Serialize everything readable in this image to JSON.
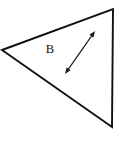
{
  "figure": {
    "background_color": "#ffffff",
    "stroke_color": "#111111",
    "canvas": {
      "width": 126,
      "height": 156
    },
    "shape": {
      "name": "triangle",
      "label": "B",
      "label_position": {
        "x": 50,
        "y": 50
      },
      "vertices": [
        {
          "x": 2,
          "y": 50
        },
        {
          "x": 113,
          "y": 9
        },
        {
          "x": 112,
          "y": 127
        }
      ]
    },
    "annotation": {
      "name": "double-headed-dimension-arrow",
      "style": "double-headed",
      "from": {
        "x": 65,
        "y": 74
      },
      "to": {
        "x": 95,
        "y": 31
      },
      "label": ""
    }
  }
}
